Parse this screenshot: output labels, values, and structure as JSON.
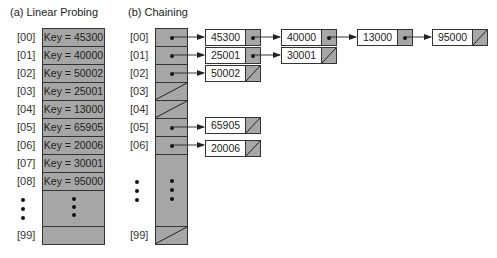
{
  "linear_probing": {
    "title": "(a) Linear Probing",
    "rows": [
      {
        "index": "[00]",
        "label": "Key = 45300"
      },
      {
        "index": "[01]",
        "label": "Key = 40000"
      },
      {
        "index": "[02]",
        "label": "Key = 50002"
      },
      {
        "index": "[03]",
        "label": "Key = 25001"
      },
      {
        "index": "[04]",
        "label": "Key = 13000"
      },
      {
        "index": "[05]",
        "label": "Key = 65905"
      },
      {
        "index": "[06]",
        "label": "Key = 20006"
      },
      {
        "index": "[07]",
        "label": "Key = 30001"
      },
      {
        "index": "[08]",
        "label": "Key = 95000"
      }
    ],
    "last_row": {
      "index": "[99]",
      "label": ""
    }
  },
  "chaining": {
    "title": "(b) Chaining",
    "rows": [
      {
        "index": "[00]",
        "chain": [
          "45300",
          "40000",
          "13000",
          "95000"
        ]
      },
      {
        "index": "[01]",
        "chain": [
          "25001",
          "30001"
        ]
      },
      {
        "index": "[02]",
        "chain": [
          "50002"
        ]
      },
      {
        "index": "[03]",
        "chain": []
      },
      {
        "index": "[04]",
        "chain": []
      },
      {
        "index": "[05]",
        "chain": [
          "65905"
        ]
      },
      {
        "index": "[06]",
        "chain": [
          "20006"
        ]
      }
    ],
    "last_row": {
      "index": "[99]",
      "chain": []
    }
  },
  "colors": {
    "cell_fill": "#a6a6a6",
    "node_fill": "#ffffff",
    "border": "#333333"
  }
}
